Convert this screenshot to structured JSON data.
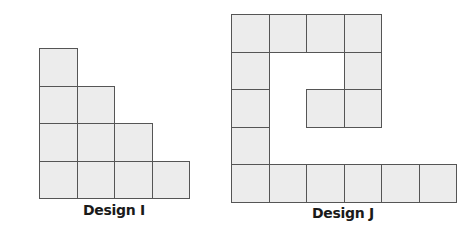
{
  "colors": {
    "tile_fill": "#ececec",
    "tile_border": "#555555",
    "label": "#1a1a1a",
    "background": "#ffffff"
  },
  "designs": [
    {
      "label": "Design I",
      "tile_count": 10,
      "cell_size": 37.5,
      "origin": [
        39,
        48
      ],
      "tiles": [
        [
          0,
          0
        ],
        [
          0,
          1
        ],
        [
          1,
          1
        ],
        [
          0,
          2
        ],
        [
          1,
          2
        ],
        [
          2,
          2
        ],
        [
          0,
          3
        ],
        [
          1,
          3
        ],
        [
          2,
          3
        ],
        [
          3,
          3
        ]
      ]
    },
    {
      "label": "Design J",
      "tile_count": 16,
      "cell_size": 37.5,
      "origin": [
        231,
        14
      ],
      "tiles": [
        [
          0,
          0
        ],
        [
          1,
          0
        ],
        [
          2,
          0
        ],
        [
          3,
          0
        ],
        [
          0,
          1
        ],
        [
          3,
          1
        ],
        [
          0,
          2
        ],
        [
          2,
          2
        ],
        [
          3,
          2
        ],
        [
          0,
          3
        ],
        [
          0,
          4
        ],
        [
          1,
          4
        ],
        [
          2,
          4
        ],
        [
          3,
          4
        ],
        [
          4,
          4
        ],
        [
          5,
          4
        ]
      ]
    }
  ]
}
